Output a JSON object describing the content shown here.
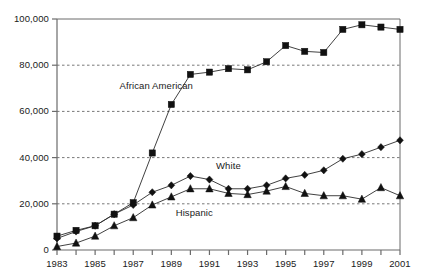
{
  "chart_data": {
    "type": "line",
    "title": "",
    "xlabel": "",
    "ylabel": "",
    "grid": "horizontal dashed gridlines at 20,000 / 40,000 / 60,000 / 80,000",
    "legend_position": "inline labels next to series",
    "xlim": [
      1983,
      2001
    ],
    "ylim": [
      0,
      100000
    ],
    "x": [
      1983,
      1984,
      1985,
      1986,
      1987,
      1988,
      1989,
      1990,
      1991,
      1992,
      1993,
      1994,
      1995,
      1996,
      1997,
      1998,
      1999,
      2000,
      2001
    ],
    "y_ticks": [
      0,
      20000,
      40000,
      60000,
      80000,
      100000
    ],
    "y_tick_labels": [
      "0",
      "20,000",
      "40,000",
      "60,000",
      "80,000",
      "100,000"
    ],
    "x_ticks": [
      1983,
      1984,
      1985,
      1986,
      1987,
      1988,
      1989,
      1990,
      1991,
      1992,
      1993,
      1994,
      1995,
      1996,
      1997,
      1998,
      1999,
      2000,
      2001
    ],
    "x_tick_labels": [
      "1983",
      "",
      "1985",
      "",
      "1987",
      "",
      "1989",
      "",
      "1991",
      "",
      "1993",
      "",
      "1995",
      "",
      "1997",
      "",
      "1999",
      "",
      "2001"
    ],
    "series": [
      {
        "name": "African American",
        "marker": "square",
        "label_x": 1988.2,
        "label_y": 71000,
        "values": [
          6000,
          8500,
          10500,
          15500,
          20500,
          42000,
          63000,
          76000,
          77000,
          78500,
          78000,
          81500,
          88500,
          86000,
          85500,
          95500,
          97500,
          96500,
          95500
        ]
      },
      {
        "name": "White",
        "marker": "diamond",
        "label_x": 1992.0,
        "label_y": 36500,
        "values": [
          5000,
          8000,
          10500,
          15500,
          19500,
          25000,
          28000,
          32000,
          30500,
          26500,
          26500,
          28000,
          31000,
          32500,
          34500,
          39500,
          41500,
          44500,
          47500
        ]
      },
      {
        "name": "Hispanic",
        "marker": "triangle",
        "label_x": 1990.2,
        "label_y": 16000,
        "values": [
          1500,
          3000,
          6000,
          10500,
          14000,
          19500,
          23000,
          26500,
          26500,
          24500,
          24000,
          25500,
          27500,
          24500,
          23500,
          23500,
          22000,
          27000,
          23500
        ]
      }
    ]
  }
}
